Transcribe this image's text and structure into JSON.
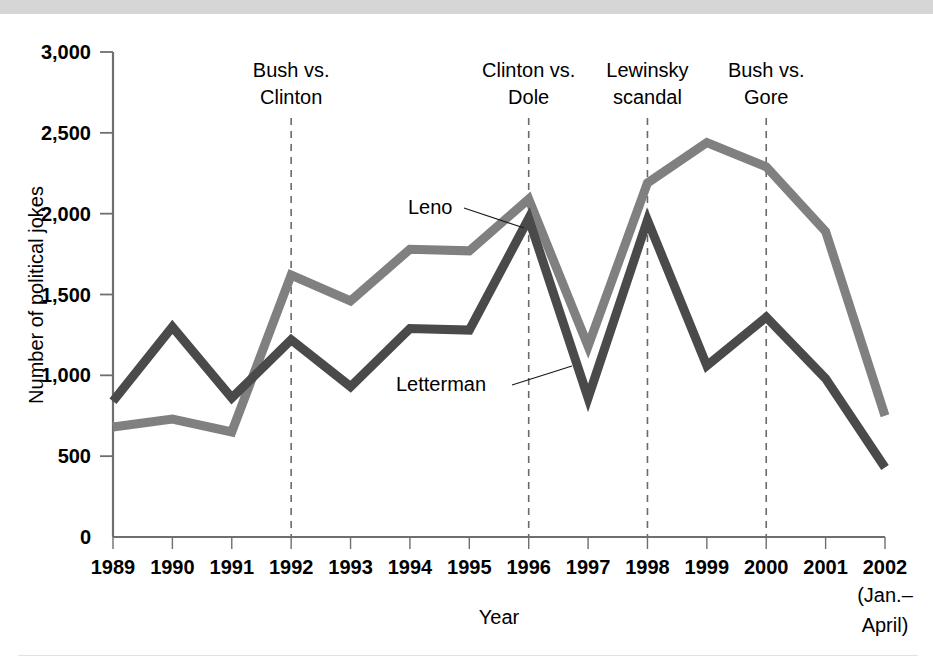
{
  "chart_data": {
    "type": "line",
    "title": "",
    "xlabel": "Year",
    "ylabel": "Number of political jokes",
    "x": [
      "1989",
      "1990",
      "1991",
      "1992",
      "1993",
      "1994",
      "1995",
      "1996",
      "1997",
      "1998",
      "1999",
      "2000",
      "2001",
      "2002"
    ],
    "x_sub_label": "(Jan.–\nApril)",
    "x_sub_label_line1": "(Jan.–",
    "x_sub_label_line2": "April)",
    "ylim": [
      0,
      3000
    ],
    "xlim_labels": [
      "1989",
      "2002"
    ],
    "y_ticks": [
      0,
      500,
      1000,
      1500,
      2000,
      2500,
      3000
    ],
    "y_tick_labels": [
      "0",
      "500",
      "1,000",
      "1,500",
      "2,000",
      "2,500",
      "3,000"
    ],
    "grid": false,
    "legend_position": "inline-annotations",
    "series": [
      {
        "name": "Leno",
        "color": "#808080",
        "values": [
          680,
          730,
          650,
          1620,
          1460,
          1780,
          1770,
          2090,
          1180,
          2190,
          2440,
          2290,
          1890,
          750
        ]
      },
      {
        "name": "Letterman",
        "color": "#4a4a4a",
        "values": [
          840,
          1300,
          860,
          1220,
          930,
          1290,
          1280,
          1970,
          860,
          1960,
          1060,
          1360,
          980,
          430
        ]
      }
    ],
    "annotations": [
      {
        "label_line1": "Bush vs.",
        "label_line2": "Clinton",
        "at_x": "1992"
      },
      {
        "label_line1": "Clinton vs.",
        "label_line2": "Dole",
        "at_x": "1996"
      },
      {
        "label_line1": "Lewinsky",
        "label_line2": "scandal",
        "at_x": "1998"
      },
      {
        "label_line1": "Bush vs.",
        "label_line2": "Gore",
        "at_x": "2000"
      }
    ],
    "series_callouts": [
      {
        "label": "Leno",
        "points_to_x": "1996"
      },
      {
        "label": "Letterman",
        "points_to_x": "1997"
      }
    ]
  },
  "colors": {
    "leno": "#808080",
    "letterman": "#4a4a4a",
    "axis": "#6f6f6f",
    "event_line": "#6a6a6a",
    "top_band": "#d6d6d6",
    "background": "#ffffff",
    "text": "#000000"
  }
}
